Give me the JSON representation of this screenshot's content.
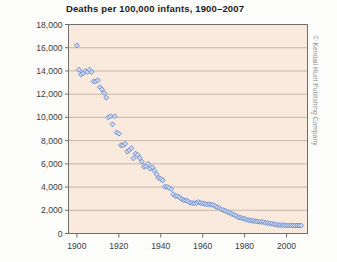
{
  "chart_data": {
    "type": "scatter",
    "title": "Deaths per 100,000 infants, 1900–2007",
    "xlabel": "",
    "ylabel": "",
    "xlim": [
      1896,
      2010
    ],
    "ylim": [
      0,
      18000
    ],
    "grid": true,
    "legend": null,
    "marker": "diamond",
    "marker_color": "#6688cc",
    "marker_fill": "#cdd9f0",
    "plot_background": "#faeade",
    "yticks": [
      0,
      2000,
      4000,
      6000,
      8000,
      10000,
      12000,
      14000,
      16000,
      18000
    ],
    "ytick_labels": [
      "0",
      "2,000",
      "4,000",
      "6,000",
      "8,000",
      "10,000",
      "12,000",
      "14,000",
      "16,000",
      "18,000"
    ],
    "xticks": [
      1900,
      1920,
      1940,
      1960,
      1980,
      2000
    ],
    "xtick_labels": [
      "1900",
      "1920",
      "1940",
      "1960",
      "1980",
      "2000"
    ],
    "x": [
      1900,
      1901,
      1902,
      1903,
      1904,
      1905,
      1906,
      1907,
      1908,
      1909,
      1910,
      1911,
      1912,
      1913,
      1914,
      1915,
      1916,
      1917,
      1918,
      1919,
      1920,
      1921,
      1922,
      1923,
      1924,
      1925,
      1926,
      1927,
      1928,
      1929,
      1930,
      1931,
      1932,
      1933,
      1934,
      1935,
      1936,
      1937,
      1938,
      1939,
      1940,
      1941,
      1942,
      1943,
      1944,
      1945,
      1946,
      1947,
      1948,
      1949,
      1950,
      1951,
      1952,
      1953,
      1954,
      1955,
      1956,
      1957,
      1958,
      1959,
      1960,
      1961,
      1962,
      1963,
      1964,
      1965,
      1966,
      1967,
      1968,
      1969,
      1970,
      1971,
      1972,
      1973,
      1974,
      1975,
      1976,
      1977,
      1978,
      1979,
      1980,
      1981,
      1982,
      1983,
      1984,
      1985,
      1986,
      1987,
      1988,
      1989,
      1990,
      1991,
      1992,
      1993,
      1994,
      1995,
      1996,
      1997,
      1998,
      1999,
      2000,
      2001,
      2002,
      2003,
      2004,
      2005,
      2006,
      2007
    ],
    "y": [
      16200,
      14100,
      13700,
      13800,
      14000,
      13900,
      14100,
      13900,
      13100,
      13100,
      13200,
      12600,
      12400,
      12100,
      11700,
      10000,
      10100,
      9400,
      10100,
      8700,
      8600,
      7600,
      7600,
      7730,
      7060,
      7180,
      7340,
      6480,
      6880,
      6780,
      6490,
      6190,
      5740,
      5810,
      6010,
      5590,
      5700,
      5410,
      5100,
      4800,
      4700,
      4580,
      4030,
      4020,
      3930,
      3820,
      3380,
      3220,
      3210,
      3110,
      2950,
      2870,
      2850,
      2780,
      2660,
      2620,
      2600,
      2630,
      2720,
      2620,
      2600,
      2550,
      2520,
      2520,
      2470,
      2470,
      2350,
      2260,
      2180,
      2070,
      2000,
      1930,
      1840,
      1780,
      1670,
      1610,
      1520,
      1400,
      1360,
      1310,
      1260,
      1190,
      1150,
      1120,
      1080,
      1070,
      1040,
      1010,
      1000,
      980,
      920,
      900,
      850,
      840,
      800,
      760,
      730,
      720,
      720,
      710,
      690,
      690,
      700,
      690,
      680,
      690,
      680,
      680
    ]
  },
  "credit": {
    "text": "© Kendall Hunt Publishing Company"
  }
}
